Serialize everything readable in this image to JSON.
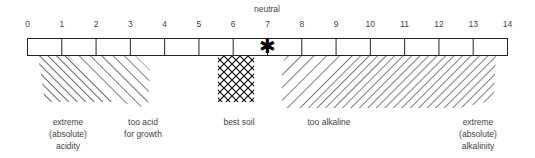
{
  "neutral_label": "neutral",
  "scale": {
    "min": 0,
    "max": 14,
    "ticks": [
      "0",
      "1",
      "2",
      "3",
      "4",
      "5",
      "6",
      "7",
      "8",
      "9",
      "10",
      "11",
      "12",
      "13",
      "14"
    ],
    "neutral_marker": {
      "value": 7,
      "symbol": "✱"
    }
  },
  "zones": [
    {
      "id": "extreme-acidity",
      "label_lines": [
        "extreme",
        "(absolute)",
        "acidity"
      ],
      "range": [
        0.25,
        2.5
      ],
      "pattern": "diagonal-dense-backslash"
    },
    {
      "id": "too-acid",
      "label_lines": [
        "too acid",
        "for growth"
      ],
      "range": [
        2.0,
        3.6
      ],
      "pattern": "diagonal-backslash"
    },
    {
      "id": "best-soil",
      "label_lines": [
        "best soil"
      ],
      "range": [
        5.7,
        6.7
      ],
      "pattern": "cross-hatch"
    },
    {
      "id": "too-alkaline",
      "label_lines": [
        "too alkaline"
      ],
      "range": [
        7.3,
        11.0
      ],
      "pattern": "diagonal-slash"
    },
    {
      "id": "extreme-alkalinity",
      "label_lines": [
        "extreme",
        "(absolute)",
        "alkalinity"
      ],
      "range": [
        10.0,
        13.5
      ],
      "pattern": "diagonal-slash-dense"
    }
  ],
  "labels": {
    "extreme_acidity": [
      "extreme",
      "(absolute)",
      "acidity"
    ],
    "too_acid": [
      "too acid",
      "for growth"
    ],
    "best_soil": "best soil",
    "too_alkaline": "too alkaline",
    "extreme_alkalinity": [
      "extreme",
      "(absolute)",
      "alkalinity"
    ]
  }
}
